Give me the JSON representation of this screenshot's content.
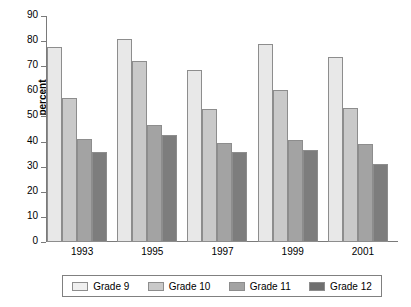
{
  "chart_data": {
    "type": "bar",
    "title": "",
    "xlabel": "",
    "ylabel": "percent",
    "ylim": [
      0,
      90
    ],
    "yticks": [
      0,
      10,
      20,
      30,
      40,
      50,
      60,
      70,
      80,
      90
    ],
    "grid": false,
    "legend_position": "bottom",
    "categories": [
      "1993",
      "1995",
      "1997",
      "1999",
      "2001"
    ],
    "series": [
      {
        "name": "Grade 9",
        "color": "#e8e8e8",
        "values": [
          77.5,
          81.0,
          68.5,
          79.0,
          73.5
        ]
      },
      {
        "name": "Grade 10",
        "color": "#c9c9c9",
        "values": [
          57.5,
          72.0,
          53.0,
          60.5,
          53.5
        ]
      },
      {
        "name": "Grade 11",
        "color": "#a3a3a3",
        "values": [
          41.0,
          46.5,
          39.5,
          40.5,
          39.0
        ]
      },
      {
        "name": "Grade 12",
        "color": "#7d7d7d",
        "values": [
          36.0,
          42.5,
          36.0,
          36.5,
          31.0
        ]
      }
    ]
  }
}
